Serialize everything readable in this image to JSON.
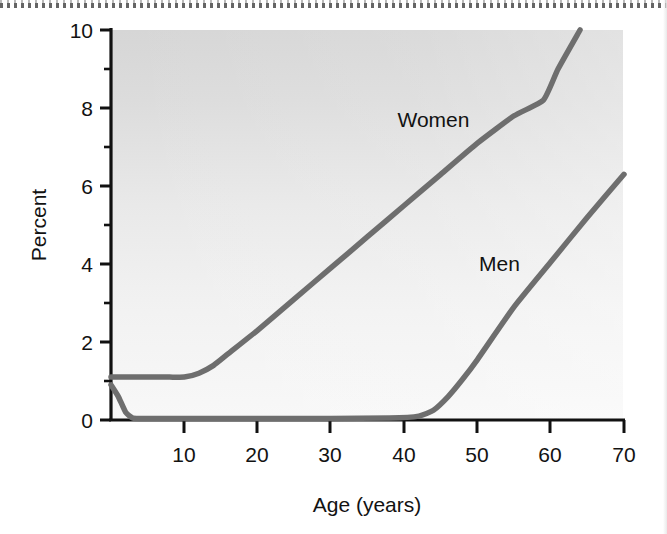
{
  "chart_data": {
    "type": "line",
    "title": "",
    "subtitle": "",
    "xlabel": "Age (years)",
    "ylabel": "Percent",
    "xlim": [
      0,
      70
    ],
    "ylim": [
      0,
      10
    ],
    "xticks": [
      10,
      20,
      30,
      40,
      50,
      60,
      70
    ],
    "xtick_labels": [
      "10",
      "20",
      "30",
      "40",
      "50",
      "60",
      "70"
    ],
    "yticks": [
      0,
      2,
      4,
      6,
      8,
      10
    ],
    "ytick_labels": [
      "0",
      "2",
      "4",
      "6",
      "8",
      "10"
    ],
    "yticks_minor": [
      1,
      3,
      5,
      7,
      9
    ],
    "grid": false,
    "legend_position": "inline-annotations",
    "series": [
      {
        "name": "Women",
        "color": "#6e6e6e",
        "label_x": 44,
        "label_y": 7.7,
        "x": [
          0,
          2,
          4,
          6,
          8,
          10,
          12,
          14,
          16,
          20,
          25,
          30,
          35,
          40,
          45,
          50,
          55,
          59,
          61,
          64
        ],
        "values": [
          1.1,
          1.1,
          1.1,
          1.1,
          1.1,
          1.1,
          1.2,
          1.4,
          1.7,
          2.3,
          3.1,
          3.9,
          4.7,
          5.5,
          6.3,
          7.1,
          7.8,
          8.2,
          9.0,
          10.0
        ]
      },
      {
        "name": "Men",
        "color": "#6e6e6e",
        "label_x": 53,
        "label_y": 4.0,
        "x": [
          0,
          1,
          2,
          3,
          5,
          10,
          20,
          30,
          38,
          42,
          44,
          46,
          48,
          50,
          55,
          60,
          65,
          70
        ],
        "values": [
          0.9,
          0.6,
          0.2,
          0.05,
          0.04,
          0.04,
          0.04,
          0.04,
          0.05,
          0.1,
          0.25,
          0.6,
          1.05,
          1.55,
          2.9,
          4.05,
          5.2,
          6.3
        ]
      }
    ]
  },
  "axes": {
    "y_title": "Percent",
    "x_title": "Age (years)"
  },
  "colors": {
    "curve": "#6e6e6e",
    "axis": "#111111",
    "text": "#121212",
    "panel_top": "#d9d9d9",
    "panel_bottom": "#f5f5f5"
  }
}
